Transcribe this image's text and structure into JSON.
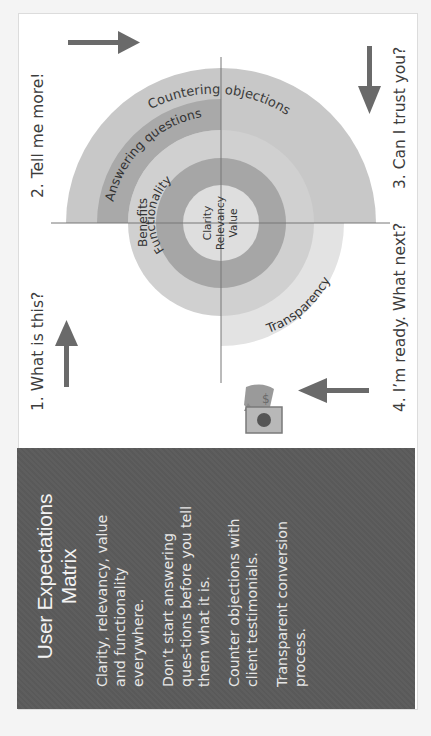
{
  "diagram": {
    "steps": [
      {
        "label": "1. What is this?",
        "arrow": "up-arrow"
      },
      {
        "label": "2. Tell me more!",
        "arrow": "right-arrow"
      },
      {
        "label": "3. Can I trust you?",
        "arrow": "down-arrow"
      },
      {
        "label": "4. I’m ready. What next?",
        "arrow": "left-arrow"
      }
    ],
    "rings": {
      "core": [
        "Clarity",
        "Relevancy",
        "Value"
      ],
      "functionality": "Functionality",
      "benefits": "Benefits",
      "answering": "Answering questions",
      "countering": "Countering objections",
      "transparency": "Transparency"
    },
    "icon": "money-bag-icon",
    "colors": {
      "countering": "#c8c8c8",
      "answering": "#a9a9a9",
      "benefits": "#d0d0d0",
      "functionality": "#a6a6a6",
      "core": "#dedede",
      "transparency": "#e3e3e3",
      "arrow": "#6a6a6a",
      "panel": "#5b5b5b"
    }
  },
  "panel": {
    "title": "User Expectations Matrix",
    "paragraphs": [
      "Clarity, relevancy, value and functionality everywhere.",
      "Don’t start answering ques-tions before you tell them what it is.",
      "Counter objections with client testimonials.",
      "Transparent conversion process."
    ]
  }
}
